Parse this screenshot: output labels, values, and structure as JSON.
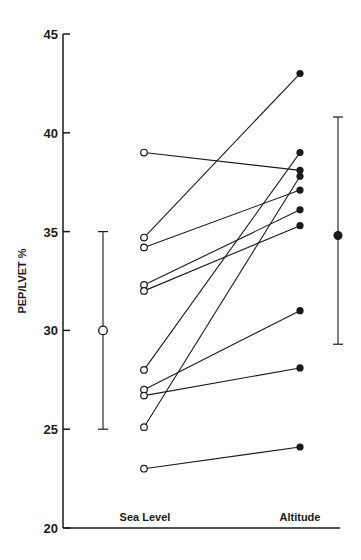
{
  "chart_data": {
    "type": "line",
    "title": "",
    "xlabel": "",
    "ylabel": "PEP/LVET %",
    "ylim": [
      20,
      45
    ],
    "yticks": [
      20,
      25,
      30,
      35,
      40,
      45
    ],
    "categories": [
      "Sea Level",
      "Altitude"
    ],
    "grid": false,
    "legend": null,
    "paired_subjects": [
      {
        "sea_level": 39.0,
        "altitude": 38.1
      },
      {
        "sea_level": 34.7,
        "altitude": 43.0
      },
      {
        "sea_level": 34.2,
        "altitude": 37.1
      },
      {
        "sea_level": 32.3,
        "altitude": 36.1
      },
      {
        "sea_level": 32.0,
        "altitude": 35.3
      },
      {
        "sea_level": 28.0,
        "altitude": 39.0
      },
      {
        "sea_level": 27.0,
        "altitude": 31.0
      },
      {
        "sea_level": 26.7,
        "altitude": 28.1
      },
      {
        "sea_level": 25.1,
        "altitude": 37.8
      },
      {
        "sea_level": 23.0,
        "altitude": 24.1
      }
    ],
    "summary": [
      {
        "name": "Sea Level",
        "mean": 30.0,
        "low": 25.0,
        "high": 35.0,
        "marker": "open-circle"
      },
      {
        "name": "Altitude",
        "mean": 34.8,
        "low": 29.3,
        "high": 40.8,
        "marker": "filled-circle"
      }
    ]
  },
  "axis": {
    "y_label": "PEP/LVET %",
    "tick_labels": [
      "45",
      "40",
      "35",
      "30",
      "25",
      "20"
    ],
    "x_labels": [
      "Sea Level",
      "Altitude"
    ]
  },
  "colors": {
    "ink": "#1a1a1a",
    "background": "#ffffff"
  }
}
